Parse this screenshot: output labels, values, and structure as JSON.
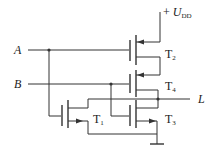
{
  "diagram": {
    "type": "CMOS logic circuit",
    "supply": {
      "sign": "+",
      "symbol": "U",
      "subscript": "DD"
    },
    "inputs": [
      {
        "label": "A"
      },
      {
        "label": "B"
      }
    ],
    "output": {
      "label": "L"
    },
    "transistors": [
      {
        "id": "T1",
        "name": "T",
        "sub": "1",
        "type": "NMOS"
      },
      {
        "id": "T2",
        "name": "T",
        "sub": "2",
        "type": "PMOS"
      },
      {
        "id": "T3",
        "name": "T",
        "sub": "3",
        "type": "NMOS"
      },
      {
        "id": "T4",
        "name": "T",
        "sub": "4",
        "type": "PMOS"
      }
    ],
    "colors": {
      "line": "#333333",
      "background": "#ffffff"
    }
  }
}
